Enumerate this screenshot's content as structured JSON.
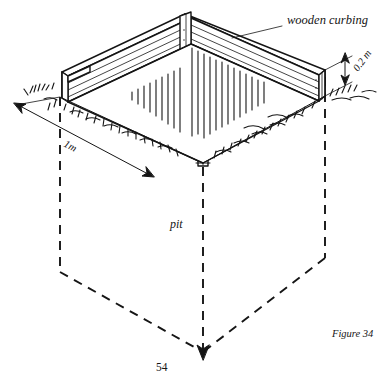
{
  "figure": {
    "caption": "Figure 34",
    "page_number": "54",
    "labels": {
      "curbing": "wooden curbing",
      "pit": "pit",
      "depth_dimension": "0.2 m",
      "width_dimension": "1m"
    },
    "colors": {
      "ink": "#151515",
      "background": "#ffffff"
    },
    "icon_names": {
      "leader_line": "leader-line-icon",
      "dimension_arrow_vertical": "dimension-arrow-vertical-icon",
      "dimension_arrow_diagonal": "dimension-arrow-diagonal-icon",
      "pit_outline": "pit-dashed-outline-icon",
      "grass_tuft": "grass-tuft-icon",
      "soil_hatch": "soil-hatch-icon",
      "corner_post": "corner-post-icon",
      "plank": "plank-icon"
    }
  }
}
